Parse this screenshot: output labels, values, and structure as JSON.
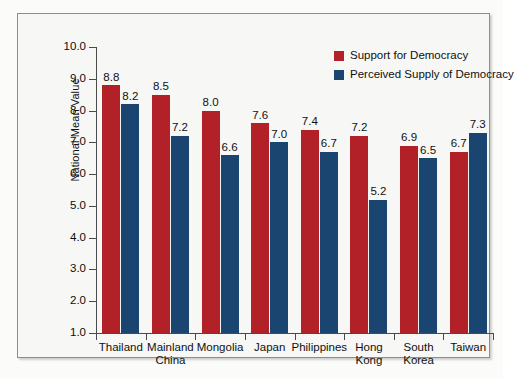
{
  "chart_data": {
    "type": "bar",
    "title": "",
    "xlabel": "",
    "ylabel": "National Mean Value",
    "ylim": [
      1.0,
      10.0
    ],
    "ytick_labels": [
      "10.0",
      "9.0",
      "8.0",
      "7.0",
      "6.0",
      "5.0",
      "4.0",
      "3.0",
      "2.0",
      "1.0"
    ],
    "ytick_values": [
      10.0,
      9.0,
      8.0,
      7.0,
      6.0,
      5.0,
      4.0,
      3.0,
      2.0,
      1.0
    ],
    "grid": false,
    "legend_position": "top-right",
    "categories": [
      "Thailand",
      "Mainland\nChina",
      "Mongolia",
      "Japan",
      "Philippines",
      "Hong\nKong",
      "South\nKorea",
      "Taiwan"
    ],
    "series": [
      {
        "name": "Support for Democracy",
        "color": "#b22028",
        "values": [
          8.8,
          8.5,
          8.0,
          7.6,
          7.4,
          7.2,
          6.9,
          6.7
        ],
        "labels": [
          "8.8",
          "8.5",
          "8.0",
          "7.6",
          "7.4",
          "7.2",
          "6.9",
          "6.7"
        ]
      },
      {
        "name": "Perceived Supply of Democracy",
        "color": "#1b4571",
        "values": [
          8.2,
          7.2,
          6.6,
          7.0,
          6.7,
          5.2,
          6.5,
          7.3
        ],
        "labels": [
          "8.2",
          "7.2",
          "6.6",
          "7.0",
          "6.7",
          "5.2",
          "6.5",
          "7.3"
        ]
      }
    ]
  },
  "legend": {
    "items": [
      {
        "label": "Support for Democracy",
        "color": "#b22028"
      },
      {
        "label": "Perceived Supply of Democracy",
        "color": "#1b4571"
      }
    ]
  }
}
